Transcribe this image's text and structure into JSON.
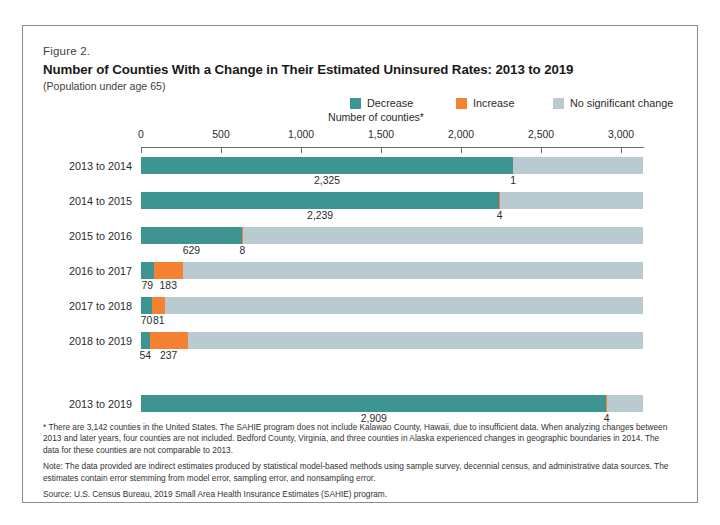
{
  "figure": {
    "label": "Figure 2.",
    "title": "Number of Counties With a Change in Their Estimated Uninsured Rates: 2013 to 2019",
    "subtitle": "(Population under age 65)"
  },
  "colors": {
    "decrease": "#3d9490",
    "increase": "#f58233",
    "no_change": "#b9cbd0",
    "axis": "#6e6e6e",
    "border": "#8c8c8c",
    "text": "#2b2b2b"
  },
  "legend": {
    "items": [
      {
        "label": "Decrease",
        "color": "#3d9490",
        "key": "decrease"
      },
      {
        "label": "Increase",
        "color": "#f58233",
        "key": "increase"
      },
      {
        "label": "No significant change",
        "color": "#b9cbd0",
        "key": "no_change"
      }
    ]
  },
  "notes": [
    "* There are 3,142 counties in the United States. The SAHIE program does not include Kalawao County, Hawaii, due to insufficient data. When analyzing changes between 2013 and later years, four counties are not included. Bedford County, Virginia, and three counties in Alaska experienced changes in geographic boundaries in 2014. The data for these counties are not comparable to 2013.",
    "Note: The data provided are indirect estimates produced by statistical model-based methods using sample survey, decennial census, and administrative data sources. The estimates contain error stemming from model error, sampling error, and nonsampling error.",
    "Source: U.S. Census Bureau, 2019 Small Area Health Insurance Estimates (SAHIE) program."
  ],
  "chart_data": {
    "type": "bar",
    "orientation": "horizontal",
    "stacked": true,
    "title": "Number of Counties With a Change in Their Estimated Uninsured Rates: 2013 to 2019",
    "subtitle": "(Population under age 65)",
    "xlabel": "Number of counties*",
    "ylabel": "",
    "xlim": [
      0,
      3142
    ],
    "xticks": [
      0,
      500,
      1000,
      1500,
      2000,
      2500,
      3000
    ],
    "xtick_labels": [
      "0",
      "500",
      "1,000",
      "1,500",
      "2,000",
      "2,500",
      "3,000"
    ],
    "grid": false,
    "legend_position": "top-right",
    "total_counties": 3142,
    "categories": [
      "2013 to 2014",
      "2014 to 2015",
      "2015 to 2016",
      "2016 to 2017",
      "2017 to 2018",
      "2018 to 2019",
      "2013 to 2019"
    ],
    "series": [
      {
        "name": "Decrease",
        "color": "#3d9490",
        "values": [
          2325,
          2239,
          629,
          79,
          70,
          54,
          2909
        ]
      },
      {
        "name": "Increase",
        "color": "#f58233",
        "values": [
          1,
          4,
          8,
          183,
          81,
          237,
          4
        ]
      },
      {
        "name": "No significant change",
        "color": "#b9cbd0",
        "values": [
          812,
          895,
          2501,
          2876,
          2987,
          2847,
          225
        ]
      }
    ],
    "bars": [
      {
        "category": "2013 to 2014",
        "group": "annual",
        "segments": [
          {
            "series": "Decrease",
            "value": 2325,
            "label": "2,325",
            "label_shown": true
          },
          {
            "series": "Increase",
            "value": 1,
            "label": "1",
            "label_shown": true
          },
          {
            "series": "No significant change",
            "value": 812,
            "label": "",
            "label_shown": false
          }
        ]
      },
      {
        "category": "2014 to 2015",
        "group": "annual",
        "segments": [
          {
            "series": "Decrease",
            "value": 2239,
            "label": "2,239",
            "label_shown": true
          },
          {
            "series": "Increase",
            "value": 4,
            "label": "4",
            "label_shown": true
          },
          {
            "series": "No significant change",
            "value": 895,
            "label": "",
            "label_shown": false
          }
        ]
      },
      {
        "category": "2015 to 2016",
        "group": "annual",
        "segments": [
          {
            "series": "Decrease",
            "value": 629,
            "label": "629",
            "label_shown": true
          },
          {
            "series": "Increase",
            "value": 8,
            "label": "8",
            "label_shown": true
          },
          {
            "series": "No significant change",
            "value": 2501,
            "label": "",
            "label_shown": false
          }
        ]
      },
      {
        "category": "2016 to 2017",
        "group": "annual",
        "segments": [
          {
            "series": "Decrease",
            "value": 79,
            "label": "79",
            "label_shown": true
          },
          {
            "series": "Increase",
            "value": 183,
            "label": "183",
            "label_shown": true
          },
          {
            "series": "No significant change",
            "value": 2876,
            "label": "",
            "label_shown": false
          }
        ]
      },
      {
        "category": "2017 to 2018",
        "group": "annual",
        "segments": [
          {
            "series": "Decrease",
            "value": 70,
            "label": "70",
            "label_shown": true
          },
          {
            "series": "Increase",
            "value": 81,
            "label": "81",
            "label_shown": true
          },
          {
            "series": "No significant change",
            "value": 2987,
            "label": "",
            "label_shown": false
          }
        ]
      },
      {
        "category": "2018 to 2019",
        "group": "annual",
        "segments": [
          {
            "series": "Decrease",
            "value": 54,
            "label": "54",
            "label_shown": true
          },
          {
            "series": "Increase",
            "value": 237,
            "label": "237",
            "label_shown": true
          },
          {
            "series": "No significant change",
            "value": 2847,
            "label": "",
            "label_shown": false
          }
        ]
      },
      {
        "category": "2013 to 2019",
        "group": "cumulative",
        "segments": [
          {
            "series": "Decrease",
            "value": 2909,
            "label": "2,909",
            "label_shown": true
          },
          {
            "series": "Increase",
            "value": 4,
            "label": "4",
            "label_shown": true
          },
          {
            "series": "No significant change",
            "value": 225,
            "label": "",
            "label_shown": false
          }
        ]
      }
    ]
  }
}
